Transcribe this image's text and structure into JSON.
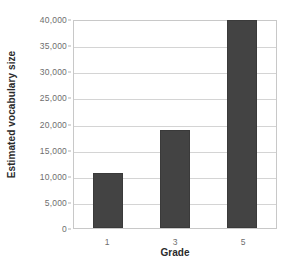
{
  "chart_data": {
    "type": "bar",
    "title": "",
    "xlabel": "Grade",
    "ylabel": "Estimated vocabulary size",
    "categories": [
      "1",
      "3",
      "5"
    ],
    "values": [
      10500,
      18700,
      39800
    ],
    "ylim": [
      0,
      40000
    ],
    "ytick_values": [
      0,
      5000,
      10000,
      15000,
      20000,
      25000,
      30000,
      35000,
      40000
    ],
    "ytick_labels": [
      "0",
      "5,000",
      "10,000",
      "15,000",
      "20,000",
      "25,000",
      "30,000",
      "35,000",
      "40,000"
    ],
    "grid": true,
    "legend": false,
    "series": [
      {
        "name": "Estimated vocabulary size",
        "values": [
          10500,
          18700,
          39800
        ]
      }
    ],
    "colors": {
      "bar_fill": "#434343",
      "gridline": "#d4d4d4",
      "plot_border": "#c8c8c8",
      "tick_text": "#6e6e6e",
      "axis_title_text": "#2b2b2b",
      "background": "#ffffff"
    }
  }
}
